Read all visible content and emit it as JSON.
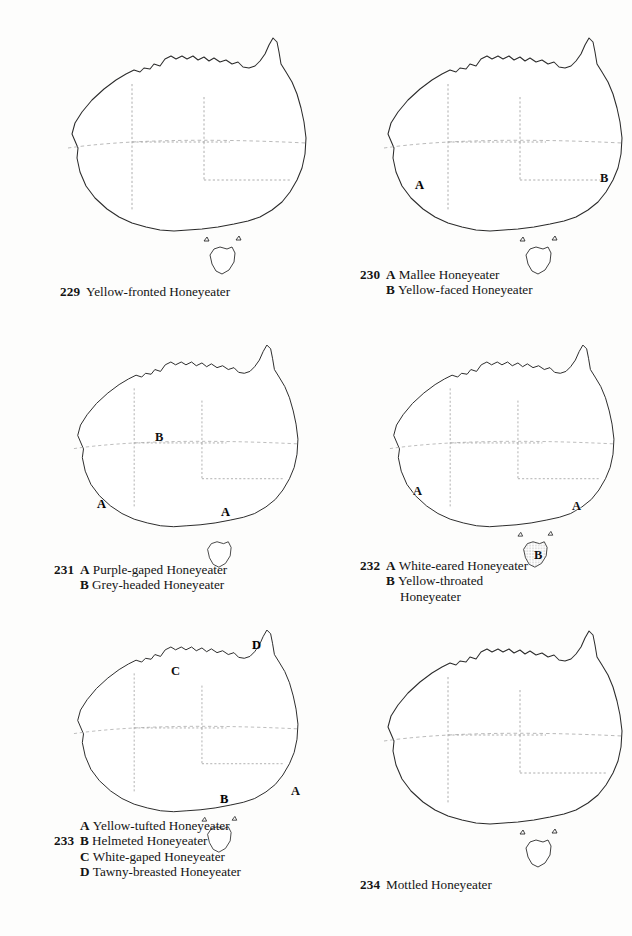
{
  "page": {
    "kind": "field-guide-distribution-map-plate",
    "panel_count": 6
  },
  "panels": [
    {
      "id": "map-229",
      "number": "229",
      "caption_lines": [
        {
          "num": "229",
          "letter": "",
          "text": "Yellow-fronted Honeyeater"
        }
      ],
      "map_labels": [],
      "ranges": [
        {
          "key": "A",
          "tone": "light",
          "description": "arid interior of the continent"
        }
      ]
    },
    {
      "id": "map-230",
      "number": "230",
      "caption_lines": [
        {
          "num": "230",
          "letter": "A",
          "text": "Mallee Honeyeater"
        },
        {
          "num": "",
          "letter": "B",
          "text": "Yellow-faced Honeyeater"
        }
      ],
      "map_labels": [
        {
          "text": "A",
          "tone": "dark"
        },
        {
          "text": "B",
          "tone": "light"
        }
      ],
      "ranges": [
        {
          "key": "A",
          "tone": "dark",
          "description": "southern mallee belt across the Nullarbor to Victoria"
        },
        {
          "key": "B",
          "tone": "light",
          "description": "eastern coastal strip from Cape York to south-east South Australia"
        }
      ]
    },
    {
      "id": "map-231",
      "number": "231",
      "caption_lines": [
        {
          "num": "231",
          "letter": "A",
          "text": "Purple-gaped Honeyeater"
        },
        {
          "num": "",
          "letter": "B",
          "text": "Grey-headed Honeyeater"
        }
      ],
      "map_labels": [
        {
          "text": "B",
          "tone": "light"
        },
        {
          "text": "A",
          "tone": "dark"
        },
        {
          "text": "A",
          "tone": "dark"
        }
      ],
      "ranges": [
        {
          "key": "B",
          "tone": "light",
          "description": "broad band across the northern and central interior"
        },
        {
          "key": "A",
          "tone": "dark",
          "description": "south-west Western Australia patch"
        },
        {
          "key": "A",
          "tone": "dark",
          "description": "south-east South Australia / north-west Victoria patch"
        }
      ]
    },
    {
      "id": "map-232",
      "number": "232",
      "caption_lines": [
        {
          "num": "232",
          "letter": "A",
          "text": "White-eared Honeyeater"
        },
        {
          "num": "",
          "letter": "B",
          "text": "Yellow-throated"
        },
        {
          "num": "",
          "letter": "",
          "text": "Honeyeater"
        }
      ],
      "map_labels": [
        {
          "text": "A",
          "tone": "light"
        },
        {
          "text": "A",
          "tone": "light"
        },
        {
          "text": "B",
          "tone": "light"
        }
      ],
      "ranges": [
        {
          "key": "A",
          "tone": "light",
          "description": "south-west Western Australia"
        },
        {
          "key": "A",
          "tone": "light",
          "description": "south-eastern Australia, inland of the Great Dividing Range"
        },
        {
          "key": "B",
          "tone": "light",
          "description": "all of Tasmania"
        }
      ]
    },
    {
      "id": "map-233",
      "number": "233",
      "caption_lines": [
        {
          "num": "",
          "letter": "A",
          "text": "Yellow-tufted Honeyeater"
        },
        {
          "num": "233",
          "letter": "B",
          "text": "Helmeted Honeyeater"
        },
        {
          "num": "",
          "letter": "C",
          "text": "White-gaped Honeyeater"
        },
        {
          "num": "",
          "letter": "D",
          "text": "Tawny-breasted Honeyeater"
        }
      ],
      "map_labels": [
        {
          "text": "D",
          "tone": "solid"
        },
        {
          "text": "C",
          "tone": "light"
        },
        {
          "text": "A",
          "tone": "light"
        },
        {
          "text": "B",
          "tone": "dark"
        }
      ],
      "ranges": [
        {
          "key": "C",
          "tone": "light",
          "description": "tropical north from the Kimberley across Arnhem Land to the Gulf"
        },
        {
          "key": "D",
          "tone": "solid",
          "description": "Cape York Peninsula tip"
        },
        {
          "key": "A",
          "tone": "light",
          "description": "south-east coastal Queensland, New South Wales and Victoria"
        },
        {
          "key": "B",
          "tone": "dark",
          "description": "small central Victorian patch"
        }
      ]
    },
    {
      "id": "map-234",
      "number": "234",
      "caption_lines": [
        {
          "num": "234",
          "letter": "",
          "text": "Mottled Honeyeater"
        }
      ],
      "map_labels": [],
      "ranges": [
        {
          "key": "A",
          "tone": "light",
          "description": "narrow north-east Queensland coastal strip"
        }
      ]
    }
  ],
  "legend_tones": {
    "light": "#cfcfcf",
    "dark": "#9a9a9a",
    "solid": "#8a8a8a",
    "coastline": "#2b2b2b",
    "state_border": "#9a9a9a",
    "tropic_line": "#a8a8a8",
    "paper": "#fdfdfc"
  }
}
